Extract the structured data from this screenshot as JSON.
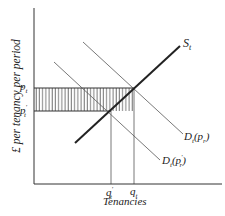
{
  "diagram": {
    "y_axis_label": "£ per tenancy per period",
    "x_axis_label": "Tenancies",
    "supply_label": "S",
    "supply_sub": "t",
    "demand1_label": "D",
    "demand1_sub": "t",
    "demand1_arg": "(p",
    "demand1_arg_sub": "r",
    "demand1_close": ")",
    "demand2_label": "D",
    "demand2_sub": "t",
    "demand2_arg": "(p",
    "demand2_arg_prime": "′",
    "demand2_arg_sub": "r",
    "demand2_close": ")",
    "price_high": "p",
    "price_high_sub": "t",
    "price_low": "p",
    "price_low_prime": "′",
    "price_low_sub": "t",
    "qty_low": "q",
    "qty_low_prime": "′",
    "qty_low_sub": "t",
    "qty_high": "q",
    "qty_high_sub": "t",
    "colors": {
      "line": "#2a2a2a",
      "thin": "#555555",
      "hatch": "#444444"
    }
  }
}
